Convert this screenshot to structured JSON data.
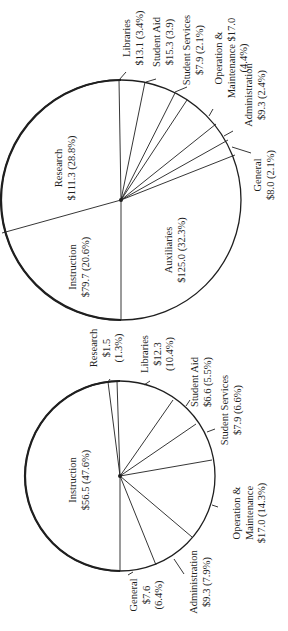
{
  "chart_data": [
    {
      "type": "pie",
      "title": "",
      "units": "$ (millions)",
      "center": [
        121,
        200
      ],
      "radius": 120,
      "start_angle_deg": -90,
      "slices": [
        {
          "label": "Libraries",
          "value": 13.1,
          "percent": "3.4%",
          "value_text": "$13.1",
          "pct_text": "(3.4%)",
          "end_pt": [
            145,
            82
          ]
        },
        {
          "label": "Student Aid",
          "value": 15.3,
          "percent": "3.9",
          "value_text": "$15.3",
          "pct_text": "(3.9)",
          "end_pt": [
            175,
            93
          ]
        },
        {
          "label": "Student Services",
          "value": 7.9,
          "percent": "2.1%",
          "value_text": "$7.9",
          "pct_text": "(2.1%)",
          "end_pt": [
            187,
            100
          ]
        },
        {
          "label": "Operation & Maintenance",
          "value": 17.0,
          "percent": "4.4%",
          "value_text": "$17.0",
          "pct_text": "(4.4%)",
          "end_pt": [
            216,
            124
          ]
        },
        {
          "label": "Administration",
          "value": 9.3,
          "percent": "2.4%",
          "value_text": "$9.3",
          "pct_text": "(2.4%)",
          "end_pt": [
            228,
            140
          ]
        },
        {
          "label": "General",
          "value": 8.0,
          "percent": "2.1%",
          "value_text": "$8.0",
          "pct_text": "(2.1%)",
          "end_pt": [
            235,
            155
          ]
        },
        {
          "label": "Auxiliaries",
          "value": 125.0,
          "percent": "32.3%",
          "value_text": "$125.0",
          "pct_text": "(32.3%)",
          "end_pt": [
            121,
            320
          ]
        },
        {
          "label": "Instruction",
          "value": 79.7,
          "percent": "20.6%",
          "value_text": "$79.7",
          "pct_text": "(20.6%)",
          "end_pt": [
            2,
            233
          ]
        },
        {
          "label": "Research",
          "value": 111.3,
          "percent": "28.8%",
          "value_text": "$111.3",
          "pct_text": "(28.8%)",
          "end_pt": [
            119,
            80
          ]
        }
      ],
      "labels": [
        {
          "lines": [
            "Research",
            "$111.3 (28.8%)"
          ],
          "x": 62,
          "y": 168
        },
        {
          "lines": [
            "Instruction",
            "$79.7 (20.6%)"
          ],
          "x": 76,
          "y": 267
        },
        {
          "lines": [
            "Auxiliaries",
            "$125.0 (32.3%)"
          ],
          "x": 172,
          "y": 250
        },
        {
          "lines": [
            "Libraries",
            "$13.1 (3.4%)"
          ],
          "x": 130,
          "y": 38
        },
        {
          "lines": [
            "Student Aid",
            "$15.3 (3.9)"
          ],
          "x": 160,
          "y": 42
        },
        {
          "lines": [
            "Student Services",
            "$7.9 (2.1%)"
          ],
          "x": 190,
          "y": 50
        },
        {
          "lines": [
            "Operation &",
            "Maintenance $17.0",
            "(4.4%)"
          ],
          "x": 222,
          "y": 58
        },
        {
          "lines": [
            "Administration",
            "$9.3 (2.4%)"
          ],
          "x": 252,
          "y": 95
        },
        {
          "lines": [
            "General",
            "$8.0 (2.1%)"
          ],
          "x": 261,
          "y": 175
        }
      ],
      "leaders": [
        [
          [
            119,
            80
          ],
          [
            126,
            72
          ]
        ],
        [
          [
            146,
            82
          ],
          [
            156,
            79
          ]
        ],
        [
          [
            175,
            92
          ],
          [
            187,
            87
          ]
        ],
        [
          [
            209,
            116
          ],
          [
            213,
            109
          ]
        ],
        [
          [
            224,
            136
          ],
          [
            233,
            131
          ]
        ],
        [
          [
            232,
            147
          ],
          [
            251,
            153
          ]
        ]
      ]
    },
    {
      "type": "pie",
      "title": "",
      "units": "$ (millions)",
      "center": [
        120,
        476
      ],
      "radius": 95,
      "start_angle_deg": -90,
      "slices": [
        {
          "label": "Research",
          "value": 1.5,
          "percent": "1.3%",
          "value_text": "$1.5",
          "pct_text": "(1.3%)",
          "end_pt": [
            117,
            381
          ]
        },
        {
          "label": "Libraries",
          "value": 12.3,
          "percent": "10.4%",
          "value_text": "$12.3",
          "pct_text": "(10.4%)",
          "end_pt": [
            173,
            400
          ]
        },
        {
          "label": "Student Aid",
          "value": 6.6,
          "percent": "5.5%",
          "value_text": "$6.6",
          "pct_text": "(5.5%)",
          "end_pt": [
            196,
            424
          ]
        },
        {
          "label": "Student Services",
          "value": 7.9,
          "percent": "6.6%",
          "value_text": "$7.9",
          "pct_text": "(6.6%)",
          "end_pt": [
            212,
            460
          ]
        },
        {
          "label": "Operation & Maintenance",
          "value": 17.0,
          "percent": "14.3%",
          "value_text": "$17.0",
          "pct_text": "(14.3%)",
          "end_pt": [
            192,
            537
          ]
        },
        {
          "label": "Administration",
          "value": 9.3,
          "percent": "7.9%",
          "value_text": "$9.3",
          "pct_text": "(7.9%)",
          "end_pt": [
            156,
            565
          ]
        },
        {
          "label": "General",
          "value": 7.6,
          "percent": "6.4%",
          "value_text": "$7.6",
          "pct_text": "(6.4%)",
          "end_pt": [
            120,
            571
          ]
        },
        {
          "label": "Instruction",
          "value": 56.5,
          "percent": "47.6%",
          "value_text": "$56.5",
          "pct_text": "(47.6%)",
          "end_pt": [
            108,
            382
          ]
        }
      ],
      "labels": [
        {
          "lines": [
            "Instruction",
            "$56.5 (47.6%)"
          ],
          "x": 76,
          "y": 480
        },
        {
          "lines": [
            "Research",
            "$1.5",
            "(1.3%)"
          ],
          "x": 97,
          "y": 348
        },
        {
          "lines": [
            "Libraries",
            "$12.3",
            "(10.4%)"
          ],
          "x": 148,
          "y": 354
        },
        {
          "lines": [
            "Student Aid",
            "$6.6 (5.5%)"
          ],
          "x": 198,
          "y": 382
        },
        {
          "lines": [
            "Student Services",
            "$7.9 (6.6%)"
          ],
          "x": 228,
          "y": 410
        },
        {
          "lines": [
            "Operation &",
            "Maintenance",
            "$17.0 (14.3%)"
          ],
          "x": 240,
          "y": 513
        },
        {
          "lines": [
            "Administration",
            "$9.3 (7.9%)"
          ],
          "x": 197,
          "y": 582
        },
        {
          "lines": [
            "General",
            "$7.6",
            "(6.4%)"
          ],
          "x": 137,
          "y": 595
        }
      ],
      "leaders": [
        [
          [
            108,
            382
          ],
          [
            110,
            379
          ]
        ],
        [
          [
            144,
            385
          ],
          [
            150,
            381
          ]
        ],
        [
          [
            186,
            406
          ],
          [
            190,
            400
          ]
        ],
        [
          [
            207,
            432
          ],
          [
            215,
            429
          ]
        ],
        [
          [
            212,
            505
          ],
          [
            218,
            507
          ]
        ],
        [
          [
            174,
            559
          ],
          [
            184,
            574
          ]
        ],
        [
          [
            128,
            575
          ],
          [
            133,
            572
          ]
        ]
      ]
    }
  ],
  "colors": {
    "background": "#ffffff",
    "ink": "#1f1f1f"
  }
}
